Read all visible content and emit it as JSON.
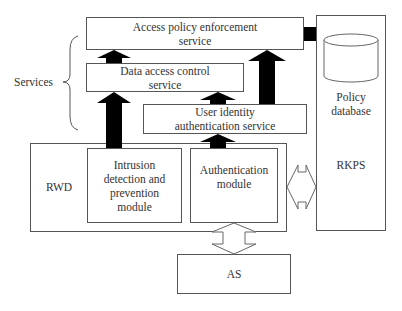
{
  "diagram": {
    "services_label": "Services",
    "boxes": {
      "access_policy": "Access policy enforcement service",
      "data_access": "Data access control service",
      "user_identity": "User identity authentication service",
      "rwd": "RWD",
      "intrusion": "Intrusion detection and prevention module",
      "authentication": "Authentication module",
      "rkps": "RKPS",
      "policy_db": "Policy database",
      "as": "AS"
    },
    "lines": {
      "access_policy_l1": "Access policy enforcement",
      "access_policy_l2": "service",
      "data_access_l1": "Data access control",
      "data_access_l2": "service",
      "user_identity_l1": "User identity",
      "user_identity_l2": "authentication service",
      "intrusion_l1": "Intrusion",
      "intrusion_l2": "detection and",
      "intrusion_l3": "prevention",
      "intrusion_l4": "module",
      "auth_l1": "Authentication",
      "auth_l2": "module",
      "policy_db_l1": "Policy",
      "policy_db_l2": "database"
    },
    "colors": {
      "stroke": "#555555",
      "arrow_fill": "#000000",
      "background": "#ffffff"
    }
  }
}
